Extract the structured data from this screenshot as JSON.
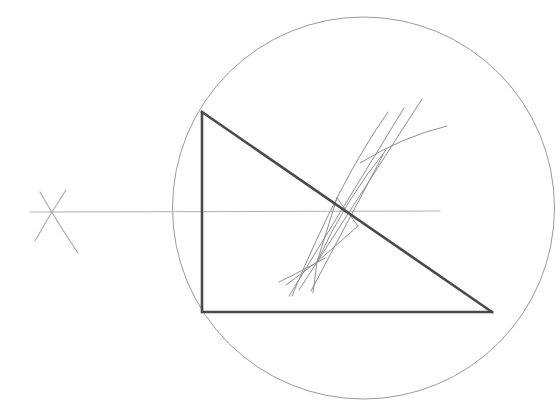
{
  "canvas": {
    "width": 560,
    "height": 413,
    "background": "#ffffff",
    "title": "Right triangle inscribed in circle with perpendicular bisector construction"
  },
  "palette": {
    "heavy_stroke": "#4a4a4a",
    "light_stroke": "#9a9a9a",
    "faint_stroke": "#b4b4b4",
    "background": "#ffffff"
  },
  "figure": {
    "circle": {
      "label": "circumscribed-circle",
      "cx": 363.5,
      "cy": 208,
      "r": 191,
      "stroke": "#9a9a9a",
      "stroke_width": 1,
      "fill": "none"
    },
    "triangle": {
      "label": "right-triangle",
      "stroke": "#4a4a4a",
      "stroke_width": 2.6,
      "fill": "none",
      "vertices": [
        {
          "name": "top-left-vertex",
          "x": 202,
          "y": 112
        },
        {
          "name": "bottom-left-vertex",
          "x": 202,
          "y": 312
        },
        {
          "name": "bottom-right-vertex",
          "x": 492,
          "y": 312
        }
      ],
      "points_string": "202,112 202,312 492,312"
    },
    "horizontal_line": {
      "label": "horizontal-axis-line",
      "x1": 30,
      "y1": 212,
      "x2": 440,
      "y2": 211,
      "stroke": "#b4b4b4",
      "stroke_width": 1
    },
    "cross_mark": {
      "label": "left-cross-mark",
      "center_x": 49,
      "center_y": 213,
      "strokes": [
        {
          "name": "cross-stroke-a",
          "d": "M 40 192 Q 57 222 78 253",
          "stroke": "#a8a8a8"
        },
        {
          "name": "cross-stroke-b",
          "d": "M 66 190 Q 50 214 35 241",
          "stroke": "#a8a8a8"
        }
      ],
      "stroke_width": 1
    },
    "construction": {
      "label": "perpendicular-bisector-construction",
      "upper_node": {
        "name": "upper-arc-intersection",
        "x": 383,
        "y": 155
      },
      "lower_node": {
        "name": "lower-arc-intersection",
        "x": 317,
        "y": 262
      },
      "stroke": "#8f8f8f",
      "stroke_width": 1,
      "arcs": [
        {
          "name": "arc-upper-right",
          "d": "M 383 155 Q 418 131 447 126"
        },
        {
          "name": "arc-left-sweep",
          "d": "M 388 112 Q 330 185 292 296"
        },
        {
          "name": "arc-lower-left",
          "d": "M 317 262 Q 296 274 279 282"
        }
      ],
      "lines": [
        {
          "name": "bisector-line-main",
          "x1": 422,
          "y1": 99,
          "x2": 299,
          "y2": 290
        },
        {
          "name": "bisector-line-secondary",
          "x1": 404,
          "y1": 108,
          "x2": 289,
          "y2": 296
        },
        {
          "name": "chord-line-upper",
          "x1": 383,
          "y1": 155,
          "x2": 311,
          "y2": 291
        },
        {
          "name": "kite-left-edge",
          "x1": 317,
          "y1": 262,
          "x2": 337,
          "y2": 198
        },
        {
          "name": "kite-right-edge",
          "x1": 337,
          "y1": 198,
          "x2": 358,
          "y2": 226
        },
        {
          "name": "kite-lower-edge",
          "x1": 358,
          "y1": 226,
          "x2": 317,
          "y2": 262
        },
        {
          "name": "tail-stroke-a",
          "x1": 317,
          "y1": 262,
          "x2": 313,
          "y2": 293
        },
        {
          "name": "tail-stroke-b",
          "x1": 317,
          "y1": 262,
          "x2": 286,
          "y2": 285
        }
      ]
    }
  }
}
